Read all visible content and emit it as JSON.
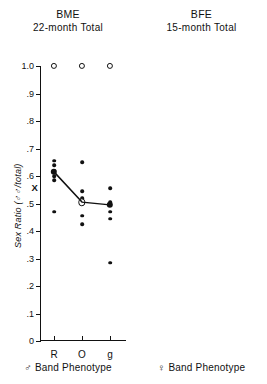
{
  "figure": {
    "background": "#ffffff",
    "ink": "#111111"
  },
  "panels": [
    {
      "id": "bme",
      "title_line1": "BME",
      "title_line2": "22-month Total",
      "x_axis_title": "♂ Band Phenotype",
      "y_axis_title": "Sex Ratio (♂♂/total)",
      "mean_symbol": "X",
      "mean_symbol_value": 0.555,
      "categories": [
        "R",
        "O",
        "g"
      ],
      "mean_line": [
        0.615,
        0.505,
        0.495
      ]
    },
    {
      "id": "bfe",
      "title_line1": "BFE",
      "title_line2": "15-month Total",
      "x_axis_title": "♀ Band Phenotype",
      "y_axis_title": "",
      "mean_symbol": "X",
      "mean_symbol_value": 0.515,
      "categories": [
        "Bl",
        "O",
        "b"
      ],
      "mean_line": [
        0.475,
        0.525,
        0.605
      ]
    }
  ],
  "y_ticks": [
    "1.0",
    ".9",
    ".8",
    ".7",
    ".6",
    ".5",
    ".4",
    ".3",
    ".2",
    ".1",
    "0"
  ],
  "y_tick_values": [
    1.0,
    0.9,
    0.8,
    0.7,
    0.6,
    0.5,
    0.4,
    0.3,
    0.2,
    0.1,
    0.0
  ],
  "chart_data": {
    "type": "scatter",
    "ylabel": "Sex Ratio (♂♂/total)",
    "ylim": [
      0,
      1.0
    ],
    "ytick_step": 0.1,
    "grid": false,
    "legend": "none",
    "panels": [
      {
        "name": "BME",
        "subtitle": "22-month Total",
        "xlabel": "♂ Band Phenotype",
        "categories": [
          "R",
          "O",
          "g"
        ],
        "groups": [
          {
            "category": "R",
            "points": [
              {
                "value": 1.0,
                "style": "open"
              },
              {
                "value": 0.655,
                "style": "filled"
              },
              {
                "value": 0.64,
                "style": "filled"
              },
              {
                "value": 0.62,
                "style": "filled"
              },
              {
                "value": 0.6,
                "style": "filled"
              },
              {
                "value": 0.585,
                "style": "filled"
              },
              {
                "value": 0.47,
                "style": "filled"
              }
            ],
            "mean": {
              "value": 0.615,
              "style": "filled-large"
            }
          },
          {
            "category": "O",
            "points": [
              {
                "value": 1.0,
                "style": "open"
              },
              {
                "value": 0.65,
                "style": "filled"
              },
              {
                "value": 0.545,
                "style": "filled"
              },
              {
                "value": 0.52,
                "style": "filled"
              },
              {
                "value": 0.455,
                "style": "filled"
              },
              {
                "value": 0.425,
                "style": "filled"
              }
            ],
            "mean": {
              "value": 0.505,
              "style": "open-large"
            }
          },
          {
            "category": "g",
            "points": [
              {
                "value": 1.0,
                "style": "open"
              },
              {
                "value": 0.555,
                "style": "filled"
              },
              {
                "value": 0.505,
                "style": "filled"
              },
              {
                "value": 0.495,
                "style": "filled"
              },
              {
                "value": 0.47,
                "style": "filled"
              },
              {
                "value": 0.445,
                "style": "filled"
              },
              {
                "value": 0.285,
                "style": "filled"
              }
            ],
            "mean": {
              "value": 0.495,
              "style": "filled-large"
            }
          }
        ]
      },
      {
        "name": "BFE",
        "subtitle": "15-month Total",
        "xlabel": "♀ Band Phenotype",
        "categories": [
          "Bl",
          "O",
          "b"
        ],
        "groups": [
          {
            "category": "Bl",
            "points": [
              {
                "value": 0.62,
                "style": "filled"
              },
              {
                "value": 0.525,
                "style": "filled"
              },
              {
                "value": 0.45,
                "style": "filled"
              },
              {
                "value": 0.43,
                "style": "filled"
              },
              {
                "value": 0.41,
                "style": "filled"
              },
              {
                "value": 0.395,
                "style": "filled"
              },
              {
                "value": 0.285,
                "style": "filled"
              }
            ],
            "mean": {
              "value": 0.475,
              "style": "filled-large"
            }
          },
          {
            "category": "O",
            "points": [
              {
                "value": 1.0,
                "style": "open"
              },
              {
                "value": 0.7,
                "style": "open"
              },
              {
                "value": 0.59,
                "style": "filled"
              },
              {
                "value": 0.575,
                "style": "filled"
              },
              {
                "value": 0.54,
                "style": "filled"
              },
              {
                "value": 0.47,
                "style": "filled"
              },
              {
                "value": 0.44,
                "style": "filled"
              },
              {
                "value": 0.42,
                "style": "filled"
              },
              {
                "value": 0.405,
                "style": "filled"
              },
              {
                "value": 0.37,
                "style": "filled"
              }
            ],
            "mean": {
              "value": 0.525,
              "style": "filled-large"
            }
          },
          {
            "category": "b",
            "points": [
              {
                "value": 1.0,
                "style": "open"
              },
              {
                "value": 0.685,
                "style": "filled"
              },
              {
                "value": 0.645,
                "style": "filled"
              },
              {
                "value": 0.63,
                "style": "filled"
              },
              {
                "value": 0.61,
                "style": "filled"
              },
              {
                "value": 0.595,
                "style": "filled"
              },
              {
                "value": 0.52,
                "style": "open"
              },
              {
                "value": 0.43,
                "style": "filled"
              },
              {
                "value": 0.415,
                "style": "filled"
              }
            ],
            "mean": {
              "value": 0.605,
              "style": "filled-large"
            }
          }
        ]
      }
    ]
  }
}
